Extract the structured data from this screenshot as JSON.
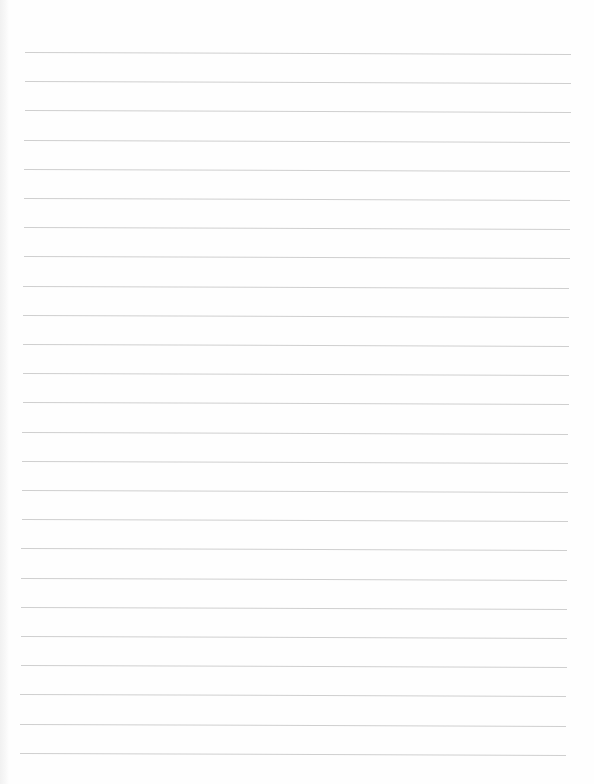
{
  "document": {
    "type": "ruled-notebook-sheet",
    "content_text": "",
    "line_count": 25,
    "first_line_y": 52,
    "line_spacing": 29.2,
    "line_start_x_top": 25,
    "line_start_x_bottom": 20,
    "line_end_x_top": 571,
    "line_end_x_bottom": 566,
    "slope_deg": 0.2
  },
  "colors": {
    "paper": "#fefefe",
    "rule": "#cfcfcf",
    "edge_shadow": "#f1f1f1"
  }
}
